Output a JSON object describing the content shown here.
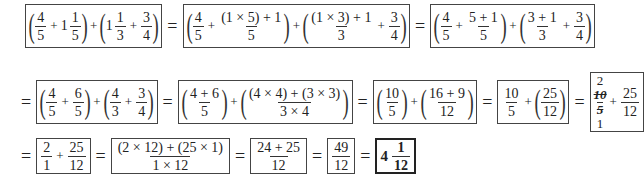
{
  "row1": {
    "step1": {
      "a_num": "4",
      "a_den": "5",
      "b_whole": "1",
      "b_num": "1",
      "b_den": "5",
      "c_whole": "1",
      "c_num": "1",
      "c_den": "3",
      "d_num": "3",
      "d_den": "4"
    },
    "step2": {
      "a_num": "4",
      "a_den": "5",
      "b_num": "(1 × 5) + 1",
      "b_den": "5",
      "c_num": "(1 × 3) + 1",
      "c_den": "3",
      "d_num": "3",
      "d_den": "4"
    },
    "step3": {
      "a_num": "4",
      "a_den": "5",
      "b_num": "5 + 1",
      "b_den": "5",
      "c_num": "3 + 1",
      "c_den": "3",
      "d_num": "3",
      "d_den": "4"
    }
  },
  "row2": {
    "step4": {
      "a_num": "4",
      "a_den": "5",
      "b_num": "6",
      "b_den": "5",
      "c_num": "4",
      "c_den": "3",
      "d_num": "3",
      "d_den": "4"
    },
    "step5": {
      "a_num": "4 + 6",
      "a_den": "5",
      "b_num": "(4 × 4) + (3 × 3)",
      "b_den": "3 × 4"
    },
    "step6": {
      "a_num": "10",
      "a_den": "5",
      "b_num": "16 + 9",
      "b_den": "12"
    },
    "step7": {
      "a_num": "10",
      "a_den": "5",
      "b_num": "25",
      "b_den": "12"
    },
    "step8": {
      "cancel_top": "2",
      "cancel_num": "10",
      "cancel_den": "5",
      "cancel_bottom": "1",
      "b_num": "25",
      "b_den": "12"
    }
  },
  "row3": {
    "step9": {
      "a_num": "2",
      "a_den": "1",
      "b_num": "25",
      "b_den": "12"
    },
    "step10": {
      "num": "(2 × 12) + (25 × 1)",
      "den": "1 × 12"
    },
    "step11": {
      "num": "24 + 25",
      "den": "12"
    },
    "step12": {
      "num": "49",
      "den": "12"
    },
    "answer": {
      "whole": "4",
      "num": "1",
      "den": "12"
    }
  },
  "symbols": {
    "equals": "=",
    "plus": "+",
    "lparen": "(",
    "rparen": ")"
  }
}
